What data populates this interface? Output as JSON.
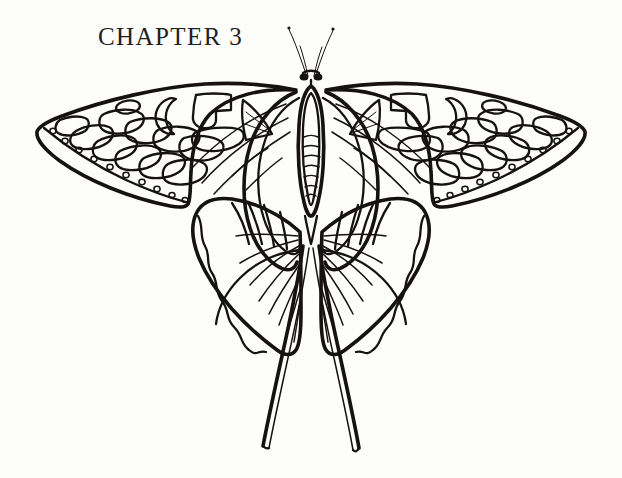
{
  "page": {
    "width": 622,
    "height": 478,
    "background_color": "#fdfdfb",
    "ink_color": "#15120f",
    "medium": "scanned book page, pen-and-ink line illustration"
  },
  "heading": {
    "label": "CHAPTER 3",
    "chapter_number": "3",
    "word": "CHAPTER",
    "position": "upper-left",
    "style": "serif small-caps display"
  },
  "illustration": {
    "title": "butterfly-plate",
    "subject": "swallowtail butterfly, dorsal view, wings spread",
    "style": "black ink contour line drawing, no shading, white fill",
    "symmetry": "bilateral mirror about vertical centre axis",
    "center_axis_x": 311,
    "parts": {
      "antennae": {
        "name": "antennae",
        "count": 2,
        "description": "two thin filaments sweeping up and outward from head, slightly clubbed tips",
        "tip_left": [
          290,
          28
        ],
        "tip_right": [
          332,
          30
        ]
      },
      "head": {
        "name": "head",
        "description": "small dark knot with two round compound-eye blobs at antenna base",
        "eye_count": 2,
        "position": [
          311,
          76
        ]
      },
      "thorax": {
        "name": "thorax",
        "description": "narrow vertical oval above abdomen"
      },
      "abdomen": {
        "name": "abdomen",
        "description": "elongated vertical ellipse with horizontal segment bands",
        "segment_count": 6
      },
      "forewings": {
        "name": "forewings",
        "count": 2,
        "description": "large triangular wings sweeping outward and upward to pointed apex",
        "left_apex": [
          36,
          130
        ],
        "right_apex": [
          586,
          130
        ],
        "margin_dots_per_wing": 10,
        "cell_shapes": [
          "small oval spot",
          "crescent lunule",
          "notched rectangular band",
          "triangular wedge with parallel hatching",
          "row of elongated rounded bar cells"
        ]
      },
      "hindwings": {
        "name": "hindwings",
        "count": 2,
        "description": "rounded lobed wings below forewings with fan of radiating veins and wavy scalloped outer margin",
        "radiating_vein_count_per_wing": 9,
        "margin": "wavy scalloped"
      },
      "tails": {
        "name": "swallowtail-tails",
        "count": 2,
        "description": "two long slender tails descending from hindwing lobes, drawn as narrow double lines with blunt tips",
        "left_tip": [
          262,
          448
        ],
        "right_tip": [
          364,
          452
        ]
      },
      "inner_veins": {
        "name": "inner-wing-veins",
        "description": "thick elongated U-shaped vein loops framing the body on both sides"
      }
    }
  }
}
